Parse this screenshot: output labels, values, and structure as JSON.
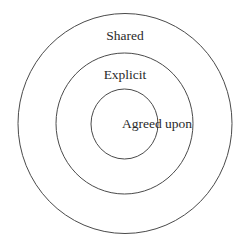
{
  "diagram": {
    "type": "concentric-circles",
    "stroke_color": "#4a4a4a",
    "text_color": "#2a2a2a",
    "background": "#ffffff",
    "layers": [
      {
        "label": "Shared",
        "level": "outer"
      },
      {
        "label": "Explicit",
        "level": "middle"
      },
      {
        "label": "Agreed upon",
        "level": "inner"
      }
    ]
  }
}
